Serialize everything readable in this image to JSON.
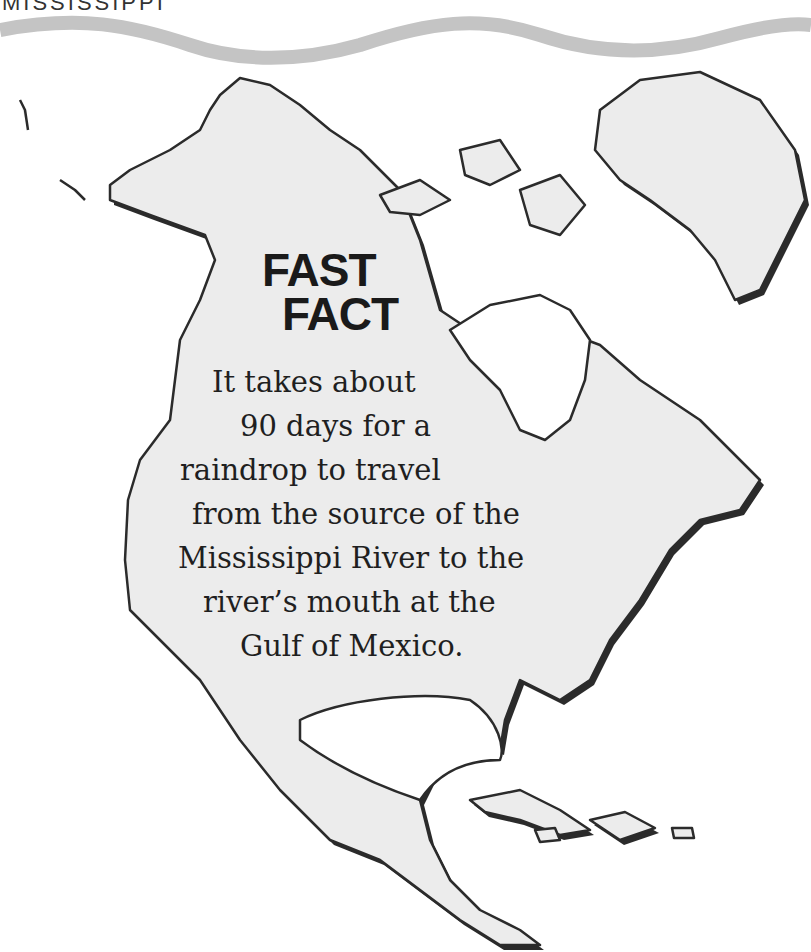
{
  "page": {
    "header_fragment": "MISSISSIPPI"
  },
  "map": {
    "region": "North America",
    "fill_color": "#ececec",
    "outline_color": "#2b2b2b",
    "wave_color": "#c4c4c4"
  },
  "fast_fact": {
    "title_line1": "FAST",
    "title_line2": "FACT",
    "lines": [
      "It takes about",
      "90 days for a",
      "raindrop to travel",
      "from the source of the",
      "Mississippi River to the",
      "river’s mouth at the",
      "Gulf of Mexico."
    ]
  }
}
